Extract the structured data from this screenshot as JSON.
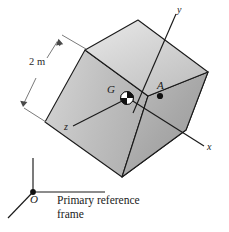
{
  "figure": {
    "background_color": "#ffffff",
    "line_color": "#1a1a1a",
    "dimension_line_color": "#6b6b6b",
    "face_colors": {
      "top": "#cfcfcf",
      "front_left": "#c4c4c4",
      "front_right": "#a9a9a9",
      "bottom_sliver": "#9a9a9a"
    }
  },
  "labels": {
    "axis_y": "y",
    "axis_x": "x",
    "axis_z": "z",
    "point_g": "G",
    "point_a": "A",
    "dimension": "2 m",
    "origin": "O",
    "caption_line1": "Primary reference",
    "caption_line2": "frame",
    "caption": "Primary reference\nframe"
  },
  "markers": {
    "center_of_mass": "center-of-mass-symbol",
    "point_a_marker": "filled-dot"
  },
  "geometry": {
    "cube_edge_length_m": 2,
    "vertices": {
      "top": [
        138,
        20
      ],
      "upper_left": [
        85,
        50
      ],
      "right": [
        208,
        72
      ],
      "center_front": [
        148,
        96
      ],
      "left": [
        45,
        122
      ],
      "bottom": [
        122,
        177
      ],
      "lower_right": [
        186,
        130
      ]
    },
    "axes_endpoints": {
      "y_tip": [
        176,
        12
      ],
      "x_tip": [
        205,
        147
      ],
      "z_tip": [
        72,
        127
      ]
    },
    "reference_frame": {
      "origin": [
        33,
        192
      ],
      "up_tip": [
        33,
        158
      ],
      "right_tip": [
        104,
        192
      ],
      "diag_tip": [
        8,
        218
      ]
    }
  }
}
